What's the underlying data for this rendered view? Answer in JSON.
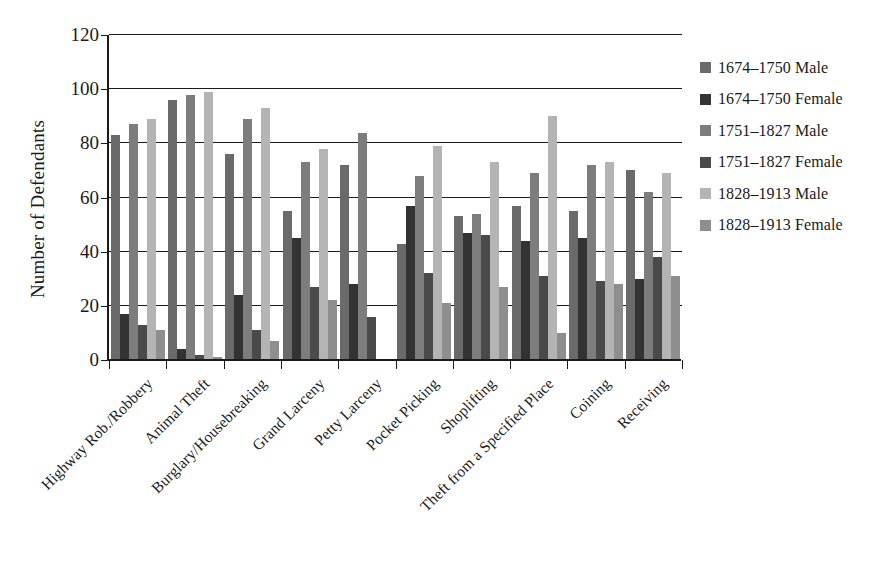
{
  "chart_data": {
    "type": "bar",
    "title": "",
    "xlabel": "",
    "ylabel": "Number of Defendants",
    "ylim": [
      0,
      120
    ],
    "yticks": [
      0,
      20,
      40,
      60,
      80,
      100,
      120
    ],
    "grid": true,
    "legend_position": "right",
    "categories": [
      "Highway Rob./Robbery",
      "Animal Theft",
      "Burglary/Housebreaking",
      "Grand Larceny",
      "Petty Larceny",
      "Pocket Picking",
      "Shoplifting",
      "Theft from a Specified Place",
      "Coining",
      "Receiving"
    ],
    "series": [
      {
        "name": "1674–1750 Male",
        "color": "#6a6a6a",
        "values": [
          83,
          96,
          76,
          55,
          72,
          43,
          53,
          57,
          55,
          70
        ]
      },
      {
        "name": "1674–1750 Female",
        "color": "#333333",
        "values": [
          17,
          4,
          24,
          45,
          28,
          57,
          47,
          44,
          45,
          30
        ]
      },
      {
        "name": "1751–1827 Male",
        "color": "#7d7d7d",
        "values": [
          87,
          98,
          89,
          73,
          84,
          68,
          54,
          69,
          72,
          62
        ]
      },
      {
        "name": "1751–1827 Female",
        "color": "#4a4a4a",
        "values": [
          13,
          2,
          11,
          27,
          16,
          32,
          46,
          31,
          29,
          38
        ]
      },
      {
        "name": "1828–1913 Male",
        "color": "#b4b4b4",
        "values": [
          89,
          99,
          93,
          78,
          0,
          79,
          73,
          90,
          73,
          69
        ]
      },
      {
        "name": "1828–1913 Female",
        "color": "#8e8e8e",
        "values": [
          11,
          1,
          7,
          22,
          0,
          21,
          27,
          10,
          28,
          31
        ]
      }
    ]
  },
  "axis_colors": {
    "axis_line": "#1a1a1a",
    "gridline": "#1a1a1a",
    "background": "#ffffff"
  }
}
